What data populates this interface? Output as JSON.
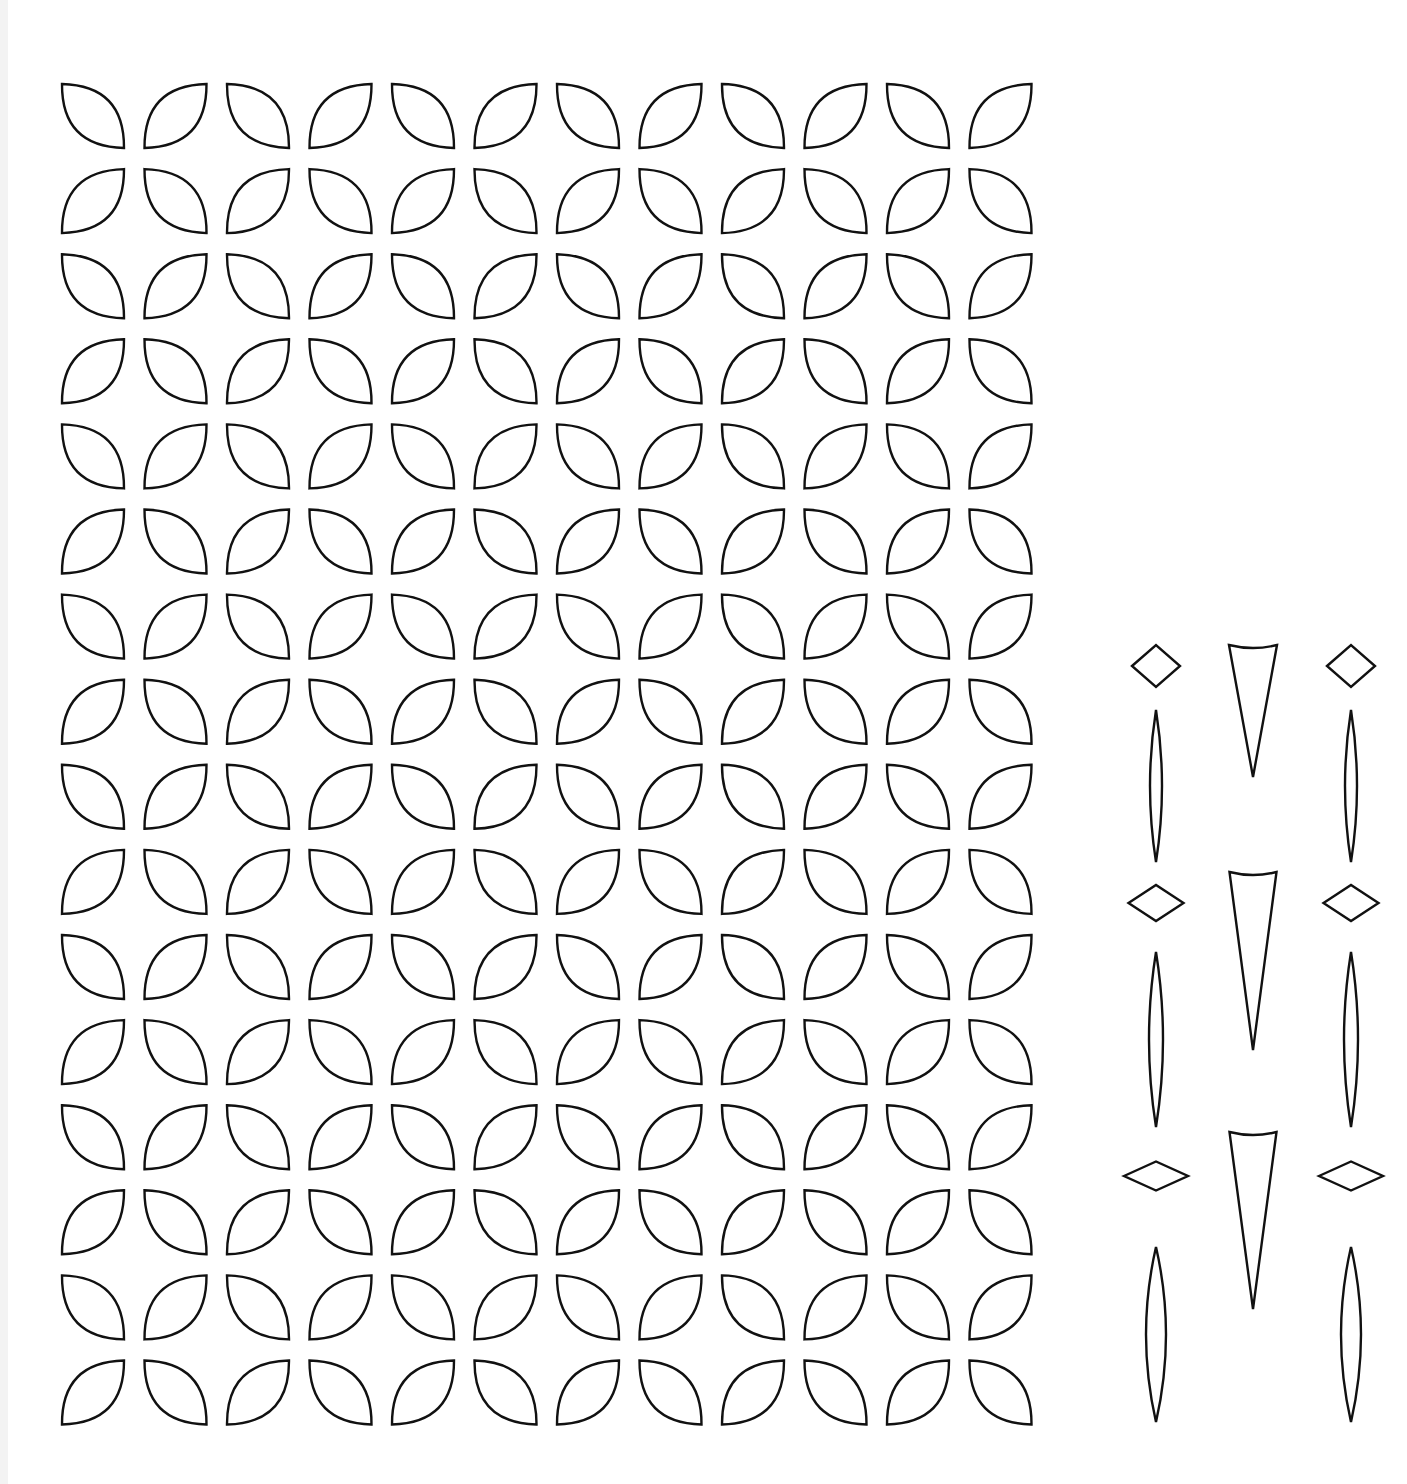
{
  "page": {
    "background": "#ffffff",
    "line_color": "#111111"
  },
  "petal_grid": {
    "columns": 12,
    "rows": 16,
    "origin_x": 62,
    "origin_y": 84,
    "step_x": 82.5,
    "step_y": 85.1,
    "leaf_width": 62,
    "leaf_height": 64,
    "bulge": 0.28,
    "orientation_rule": "(row+col) even -> backslash '\\' leaf, odd -> slash '/' leaf"
  },
  "ornaments": {
    "columns": [
      {
        "name": "left",
        "center_x": 1156
      },
      {
        "name": "middle",
        "center_x": 1253
      },
      {
        "name": "right",
        "center_x": 1351
      }
    ],
    "sets": [
      {
        "diamond": {
          "cy": 666,
          "w": 48,
          "h": 42
        },
        "needle": {
          "top": 710,
          "bottom": 862,
          "w": 12
        },
        "triangle": {
          "top": 645,
          "tip": 777,
          "w": 48
        }
      },
      {
        "diamond": {
          "cy": 903,
          "w": 55,
          "h": 36
        },
        "needle": {
          "top": 952,
          "bottom": 1127,
          "w": 14
        },
        "triangle": {
          "top": 872,
          "tip": 1050,
          "w": 47
        }
      },
      {
        "diamond": {
          "cy": 1176,
          "w": 64,
          "h": 29
        },
        "needle": {
          "top": 1247,
          "bottom": 1422,
          "w": 20
        },
        "triangle": {
          "top": 1132,
          "tip": 1309,
          "w": 47
        }
      }
    ]
  }
}
